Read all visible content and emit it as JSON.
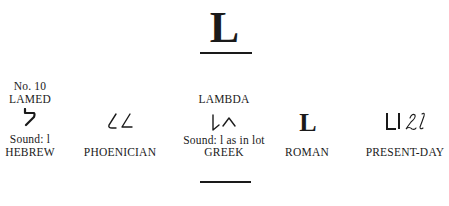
{
  "title": {
    "letter": "L"
  },
  "columns": [
    {
      "id": "hebrew",
      "number": "No. 10",
      "name": "LAMED",
      "glyph": "hebrew-lamed",
      "sound": "Sound: l",
      "label": "HEBREW"
    },
    {
      "id": "phoenician",
      "glyph": "phoenician-lamed",
      "label": "PHOENICIAN"
    },
    {
      "id": "greek",
      "name": "LAMBDA",
      "glyph": "greek-lambda",
      "sound": "Sound: l as in lot",
      "label": "GREEK"
    },
    {
      "id": "roman",
      "glyph_text": "L",
      "label": "ROMAN"
    },
    {
      "id": "present-day",
      "glyph": "present-day-L-l",
      "label": "PRESENT-DAY"
    }
  ]
}
